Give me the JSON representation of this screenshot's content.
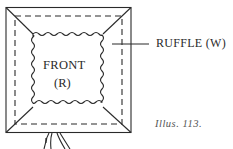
{
  "diagram": {
    "labels": {
      "front": "FRONT",
      "front_code": "(R)",
      "ruffle": "RUFFLE (W)",
      "caption": "Illus. 113."
    },
    "colors": {
      "line": "#2a2a2a",
      "background": "#ffffff"
    }
  }
}
